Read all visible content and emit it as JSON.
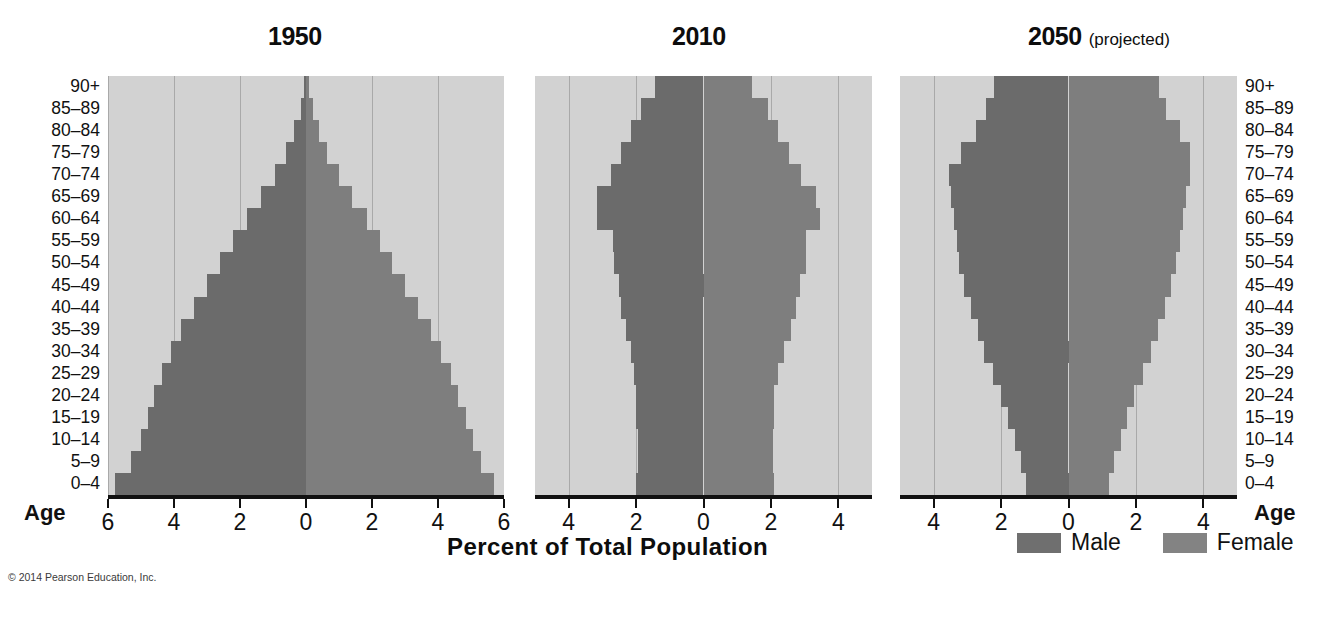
{
  "figure": {
    "axis_title": "Percent of Total Population",
    "copyright": "© 2014 Pearson Education, Inc.",
    "age_axis_title_left": "Age",
    "age_axis_title_right": "Age"
  },
  "legend": {
    "male_label": "Male",
    "female_label": "Female",
    "male_color": "#6b6b6b",
    "female_color": "#7e7e7e",
    "plot_background": "#d2d2d2",
    "gridline_color": "#a9a9a9"
  },
  "panels": [
    {
      "title": "1950",
      "subtitle": ""
    },
    {
      "title": "2010",
      "subtitle": ""
    },
    {
      "title": "2050",
      "subtitle": "(projected)"
    }
  ],
  "age_groups": [
    "90+",
    "85–89",
    "80–84",
    "75–79",
    "70–74",
    "65–69",
    "60–64",
    "55–59",
    "50–54",
    "45–49",
    "40–44",
    "35–39",
    "30–34",
    "25–29",
    "20–24",
    "15–19",
    "10–14",
    "5–9",
    "0–4"
  ],
  "chart_data": [
    {
      "type": "bar",
      "subtype": "population-pyramid",
      "title": "1950",
      "xlabel": "Percent of Total Population",
      "ylabel": "Age",
      "categories": [
        "90+",
        "85–89",
        "80–84",
        "75–79",
        "70–74",
        "65–69",
        "60–64",
        "55–59",
        "50–54",
        "45–49",
        "40–44",
        "35–39",
        "30–34",
        "25–29",
        "20–24",
        "15–19",
        "10–14",
        "5–9",
        "0–4"
      ],
      "xticks": [
        6,
        4,
        2,
        0,
        2,
        4,
        6
      ],
      "xlim": [
        6,
        6
      ],
      "grid": true,
      "series": [
        {
          "name": "Male",
          "side": "left",
          "values": [
            0.05,
            0.15,
            0.35,
            0.6,
            0.95,
            1.35,
            1.8,
            2.2,
            2.6,
            3.0,
            3.4,
            3.8,
            4.1,
            4.35,
            4.6,
            4.8,
            5.0,
            5.3,
            5.8
          ]
        },
        {
          "name": "Female",
          "side": "right",
          "values": [
            0.08,
            0.2,
            0.4,
            0.65,
            1.0,
            1.4,
            1.85,
            2.25,
            2.6,
            3.0,
            3.4,
            3.8,
            4.1,
            4.4,
            4.6,
            4.85,
            5.05,
            5.3,
            5.7
          ]
        }
      ]
    },
    {
      "type": "bar",
      "subtype": "population-pyramid",
      "title": "2010",
      "xlabel": "Percent of Total Population",
      "ylabel": "Age",
      "categories": [
        "90+",
        "85–89",
        "80–84",
        "75–79",
        "70–74",
        "65–69",
        "60–64",
        "55–59",
        "50–54",
        "45–49",
        "40–44",
        "35–39",
        "30–34",
        "25–29",
        "20–24",
        "15–19",
        "10–14",
        "5–9",
        "0–4"
      ],
      "xticks": [
        4,
        2,
        0,
        2,
        4
      ],
      "xlim": [
        5,
        5
      ],
      "grid": true,
      "series": [
        {
          "name": "Male",
          "side": "left",
          "values": [
            1.45,
            1.85,
            2.15,
            2.45,
            2.75,
            3.15,
            3.15,
            2.7,
            2.65,
            2.5,
            2.45,
            2.3,
            2.15,
            2.05,
            2.0,
            2.0,
            1.95,
            1.95,
            2.0
          ]
        },
        {
          "name": "Female",
          "side": "right",
          "values": [
            1.45,
            1.9,
            2.2,
            2.55,
            2.9,
            3.35,
            3.45,
            3.05,
            3.05,
            2.85,
            2.75,
            2.6,
            2.4,
            2.2,
            2.1,
            2.1,
            2.05,
            2.05,
            2.1
          ]
        }
      ]
    },
    {
      "type": "bar",
      "subtype": "population-pyramid",
      "title": "2050 (projected)",
      "xlabel": "Percent of Total Population",
      "ylabel": "Age",
      "categories": [
        "90+",
        "85–89",
        "80–84",
        "75–79",
        "70–74",
        "65–69",
        "60–64",
        "55–59",
        "50–54",
        "45–49",
        "40–44",
        "35–39",
        "30–34",
        "25–29",
        "20–24",
        "15–19",
        "10–14",
        "5–9",
        "0–4"
      ],
      "xticks": [
        4,
        2,
        0,
        2,
        4
      ],
      "xlim": [
        5,
        5
      ],
      "grid": true,
      "series": [
        {
          "name": "Male",
          "side": "left",
          "values": [
            2.2,
            2.45,
            2.75,
            3.2,
            3.55,
            3.5,
            3.4,
            3.3,
            3.25,
            3.1,
            2.9,
            2.7,
            2.5,
            2.25,
            2.0,
            1.8,
            1.6,
            1.4,
            1.25
          ]
        },
        {
          "name": "Female",
          "side": "right",
          "values": [
            2.7,
            2.9,
            3.3,
            3.6,
            3.6,
            3.5,
            3.4,
            3.3,
            3.2,
            3.05,
            2.85,
            2.65,
            2.45,
            2.2,
            1.95,
            1.75,
            1.55,
            1.35,
            1.2
          ]
        }
      ]
    }
  ]
}
